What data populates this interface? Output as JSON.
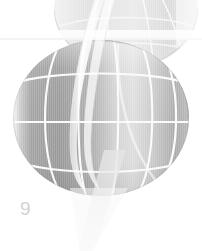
{
  "page": {
    "width": 202,
    "height": 251,
    "background_color": "#ffffff",
    "page_number": "9",
    "page_number_color": "#d2d2d2"
  },
  "artwork": {
    "title": "wireframe-globe-illustration",
    "description": "Grayscale wireframe globe with latitude and longitude lines, a faded second globe above, a translucent vertical ribbon swoosh and a pale triangular wedge",
    "palette": {
      "globe_dark": "#9a9a9a",
      "globe_mid": "#b4b4b4",
      "globe_light": "#d8d8d8",
      "globe_highlight": "#ececec",
      "gridline": "#f2f2f2",
      "ghost_globe": "#e6e6e6",
      "ribbon": "#f4f4f4",
      "wedge": "#f0f0f0",
      "band": "#fbfbfb"
    },
    "elements": [
      {
        "name": "ghost-globe",
        "label": "Faded upper globe",
        "cx": 126,
        "cy": 10,
        "rx": 72,
        "ry": 58
      },
      {
        "name": "main-globe",
        "label": "Main wireframe globe",
        "cx": 101,
        "cy": 118,
        "rx": 88,
        "ry": 78
      },
      {
        "name": "horizontal-band",
        "label": "Horizontal light band",
        "y": 31,
        "height": 9
      },
      {
        "name": "ribbon-swoosh",
        "label": "Vertical translucent ribbon"
      },
      {
        "name": "triangular-wedge",
        "label": "Pale triangular wedge below globe"
      }
    ],
    "gridlines": {
      "parallels": [
        3
      ],
      "meridians": [
        5
      ]
    }
  }
}
